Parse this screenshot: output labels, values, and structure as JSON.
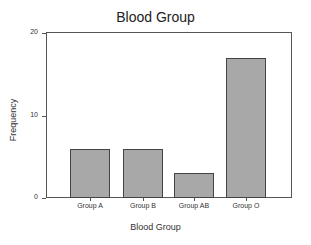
{
  "chart_data": {
    "type": "bar",
    "title": "Blood Group",
    "xlabel": "Blood Group",
    "ylabel": "Frequency",
    "categories": [
      "Group A",
      "Group B",
      "Group AB",
      "Group O"
    ],
    "values": [
      6,
      6,
      3,
      17
    ],
    "ylim": [
      0,
      20
    ],
    "yticks": [
      0,
      10,
      20
    ],
    "grid": false,
    "legend": null,
    "bar_color": "#a8a8a8",
    "bar_edge_color": "#444444"
  }
}
